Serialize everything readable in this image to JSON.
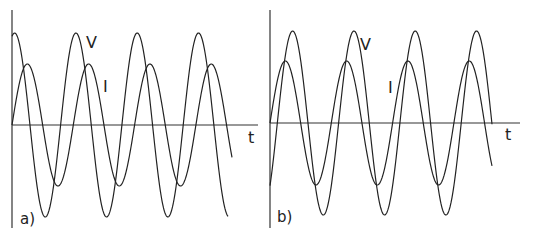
{
  "panels": [
    {
      "label": "a)",
      "v_label": "V",
      "i_label": "I",
      "t_label": "t",
      "relation": "voltage leads current"
    },
    {
      "label": "b)",
      "v_label": "V",
      "i_label": "I",
      "t_label": "t",
      "relation": "voltage lags current"
    }
  ],
  "colors": {
    "line": "#222222",
    "background": "#ffffff"
  }
}
